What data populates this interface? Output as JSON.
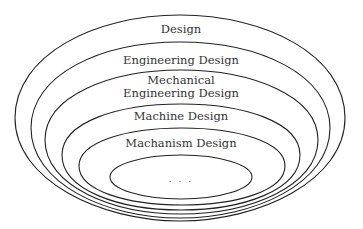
{
  "diagram": {
    "type": "nested-sets",
    "levels": [
      {
        "label": "Design"
      },
      {
        "label": "Engineering Design"
      },
      {
        "label_line1": "Mechanical",
        "label_line2": "Engineering Design"
      },
      {
        "label": "Machine Design"
      },
      {
        "label": "Machanism Design"
      },
      {
        "label": ". . ."
      }
    ],
    "stroke_color": "#222222",
    "text_color": "#333333",
    "background": "#ffffff"
  }
}
